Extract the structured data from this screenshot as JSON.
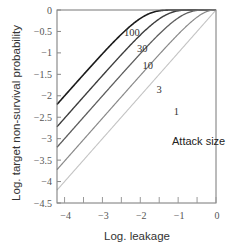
{
  "chart_data": {
    "type": "line",
    "title": "",
    "xlabel": "Log. leakage",
    "ylabel": "Log. target non-survival probability",
    "xlim": [
      -4.2,
      0
    ],
    "ylim": [
      -4.5,
      0
    ],
    "xticks": [
      -4,
      -3,
      -2,
      -1,
      0
    ],
    "xtick_labels": [
      "−4",
      "−3",
      "−2",
      "−1",
      "0"
    ],
    "xminor_ticks": [
      -3.5,
      -2.5,
      -1.5,
      -0.5
    ],
    "yticks": [
      0,
      -0.5,
      -1,
      -1.5,
      -2,
      -2.5,
      -3,
      -3.5,
      -4,
      -4.5
    ],
    "ytick_labels": [
      "0",
      "−0.5",
      "−1",
      "−1.5",
      "−2",
      "−2.5",
      "−3",
      "−3.5",
      "−4",
      "−4.5"
    ],
    "grid": false,
    "legend_title": "Attack size",
    "model": "log10(1 - (1 - 10^x)^n)",
    "series": [
      {
        "name": "100",
        "attack_size": 100,
        "color": "#1a1a1a",
        "width": 1.6,
        "x": [
          -4.2,
          -3,
          -2.5,
          -2,
          -1.5,
          -1,
          -0.5,
          0
        ],
        "values": [
          -2.2,
          -1.0,
          -0.55,
          -0.2,
          -0.02,
          0,
          0,
          0
        ]
      },
      {
        "name": "30",
        "attack_size": 30,
        "color": "#3d3d3d",
        "width": 1.4,
        "x": [
          -4.2,
          -3,
          -2.5,
          -2,
          -1.5,
          -1,
          -0.5,
          0
        ],
        "values": [
          -2.72,
          -1.54,
          -1.06,
          -0.63,
          -0.29,
          -0.07,
          0,
          0
        ]
      },
      {
        "name": "10",
        "attack_size": 10,
        "color": "#5e5e5e",
        "width": 1.3,
        "x": [
          -4.2,
          -3,
          -2.5,
          -2,
          -1.5,
          -1,
          -0.5,
          0
        ],
        "values": [
          -3.2,
          -2.0,
          -1.5,
          -1.02,
          -0.58,
          -0.2,
          -0.02,
          0
        ]
      },
      {
        "name": "3",
        "attack_size": 3,
        "color": "#8a8a8a",
        "width": 1.2,
        "x": [
          -4.2,
          -3,
          -2.5,
          -2,
          -1.5,
          -1,
          -0.5,
          0
        ],
        "values": [
          -3.72,
          -2.52,
          -2.03,
          -1.53,
          -1.05,
          -0.59,
          -0.2,
          0
        ]
      },
      {
        "name": "1",
        "attack_size": 1,
        "color": "#c4c4c4",
        "width": 1.1,
        "x": [
          -4.2,
          -3,
          -2.5,
          -2,
          -1.5,
          -1,
          -0.5,
          0
        ],
        "values": [
          -4.2,
          -3.0,
          -2.5,
          -2.0,
          -1.5,
          -1.0,
          -0.5,
          0
        ]
      }
    ],
    "curve_labels": [
      {
        "text": "100",
        "x": -2.22,
        "y": -0.6
      },
      {
        "text": "30",
        "x": -1.95,
        "y": -0.97
      },
      {
        "text": "10",
        "x": -1.8,
        "y": -1.37
      },
      {
        "text": "3",
        "x": -1.5,
        "y": -1.93
      },
      {
        "text": "1",
        "x": -1.05,
        "y": -2.45
      }
    ],
    "legend_position": {
      "x": -0.95,
      "y": -3.05
    }
  }
}
